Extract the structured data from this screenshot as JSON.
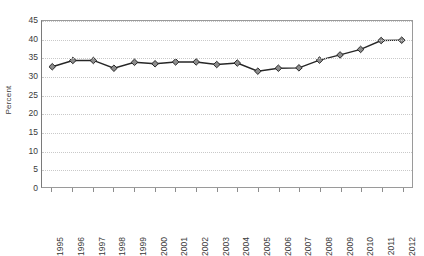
{
  "chart_data": {
    "type": "line",
    "title": "",
    "xlabel": "",
    "ylabel": "Percent",
    "ylim": [
      0,
      45
    ],
    "ytick_step": 5,
    "yticks": [
      0,
      5,
      10,
      15,
      20,
      25,
      30,
      35,
      40,
      45
    ],
    "grid": "horizontal-dotted",
    "legend": "none",
    "marker": "diamond",
    "marker_face_color": "#8c8c8c",
    "marker_edge_color": "#262626",
    "line_color": "#262626",
    "categories": [
      "1995",
      "1996",
      "1997",
      "1998",
      "1999",
      "2000",
      "2001",
      "2002",
      "2003",
      "2004",
      "2005",
      "2006",
      "2007",
      "2008",
      "2009",
      "2010",
      "2011",
      "2012"
    ],
    "values": [
      32.6,
      34.3,
      34.3,
      32.2,
      33.8,
      33.4,
      33.9,
      33.9,
      33.2,
      33.6,
      31.4,
      32.2,
      32.3,
      34.4,
      35.8,
      37.3,
      39.7,
      39.8
    ],
    "series": [
      {
        "name": "Percent",
        "values": [
          32.6,
          34.3,
          34.3,
          32.2,
          33.8,
          33.4,
          33.9,
          33.9,
          33.2,
          33.6,
          31.4,
          32.2,
          32.3,
          34.4,
          35.8,
          37.3,
          39.7,
          39.8
        ]
      }
    ]
  },
  "axes": {
    "y_title": "Percent",
    "y_labels": [
      "45",
      "40",
      "35",
      "30",
      "25",
      "20",
      "15",
      "10",
      "5",
      "0"
    ],
    "x_labels": [
      "1995",
      "1996",
      "1997",
      "1998",
      "1999",
      "2000",
      "2001",
      "2002",
      "2003",
      "2004",
      "2005",
      "2006",
      "2007",
      "2008",
      "2009",
      "2010",
      "2011",
      "2012"
    ]
  },
  "colors": {
    "line": "#262626",
    "marker_fill": "#8c8c8c",
    "marker_edge": "#262626",
    "grid": "#c9c9c9",
    "axis": "#8d8d8d",
    "text": "#3a3a3a",
    "background": "#ffffff"
  }
}
